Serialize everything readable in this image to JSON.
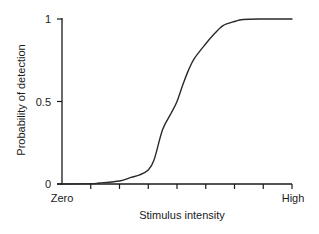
{
  "chart_data": {
    "type": "line",
    "title": "",
    "xlabel": "Stimulus intensity",
    "ylabel": "Probability of detection",
    "x_tick_labels": {
      "start": "Zero",
      "end": "High"
    },
    "x_tick_count": 8,
    "y_ticks": [
      0,
      0.5,
      1
    ],
    "y_tick_labels": [
      "0",
      "0.5",
      "1"
    ],
    "xlim": [
      0,
      8
    ],
    "ylim": [
      0,
      1
    ],
    "grid": false,
    "legend": null,
    "series": [
      {
        "name": "Psychometric function",
        "x": [
          0,
          1.0,
          1.3,
          2.0,
          2.4,
          2.7,
          3.0,
          3.2,
          3.5,
          3.8,
          4.0,
          4.2,
          4.4,
          4.6,
          5.0,
          5.3,
          5.6,
          6.0,
          6.3,
          7.0,
          8.0
        ],
        "y": [
          0,
          0.002,
          0.006,
          0.018,
          0.04,
          0.055,
          0.085,
          0.145,
          0.33,
          0.43,
          0.5,
          0.6,
          0.69,
          0.76,
          0.85,
          0.91,
          0.96,
          0.985,
          0.997,
          1.0,
          1.0
        ]
      }
    ]
  },
  "colors": {
    "line": "#2a2a2a",
    "axis": "#1a1a1a",
    "background": "#ffffff"
  }
}
